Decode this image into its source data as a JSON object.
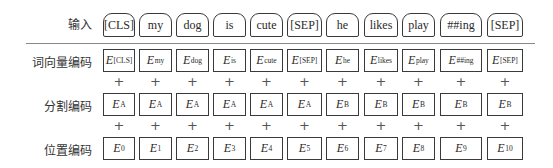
{
  "row_labels": {
    "input": "输入",
    "token_embedding": "词向量编码",
    "segment_embedding": "分割编码",
    "position_embedding": "位置编码"
  },
  "plus_symbol": "+",
  "embedding_letter": "E",
  "tokens": [
    "[CLS]",
    "my",
    "dog",
    "is",
    "cute",
    "[SEP]",
    "he",
    "likes",
    "play",
    "##ing",
    "[SEP]"
  ],
  "token_embeddings": [
    "[CLS]",
    "my",
    "dog",
    "is",
    "cute",
    "[SEP]",
    "he",
    "likes",
    "play",
    "##ing",
    "[SEP]"
  ],
  "segment_embeddings": [
    "A",
    "A",
    "A",
    "A",
    "A",
    "A",
    "B",
    "B",
    "B",
    "B",
    "B"
  ],
  "position_embeddings": [
    "0",
    "1",
    "2",
    "3",
    "4",
    "5",
    "6",
    "7",
    "8",
    "9",
    "10"
  ],
  "colors": {
    "border": "#3a3a3a",
    "separator": "#888888",
    "text": "#2a2a2a"
  }
}
